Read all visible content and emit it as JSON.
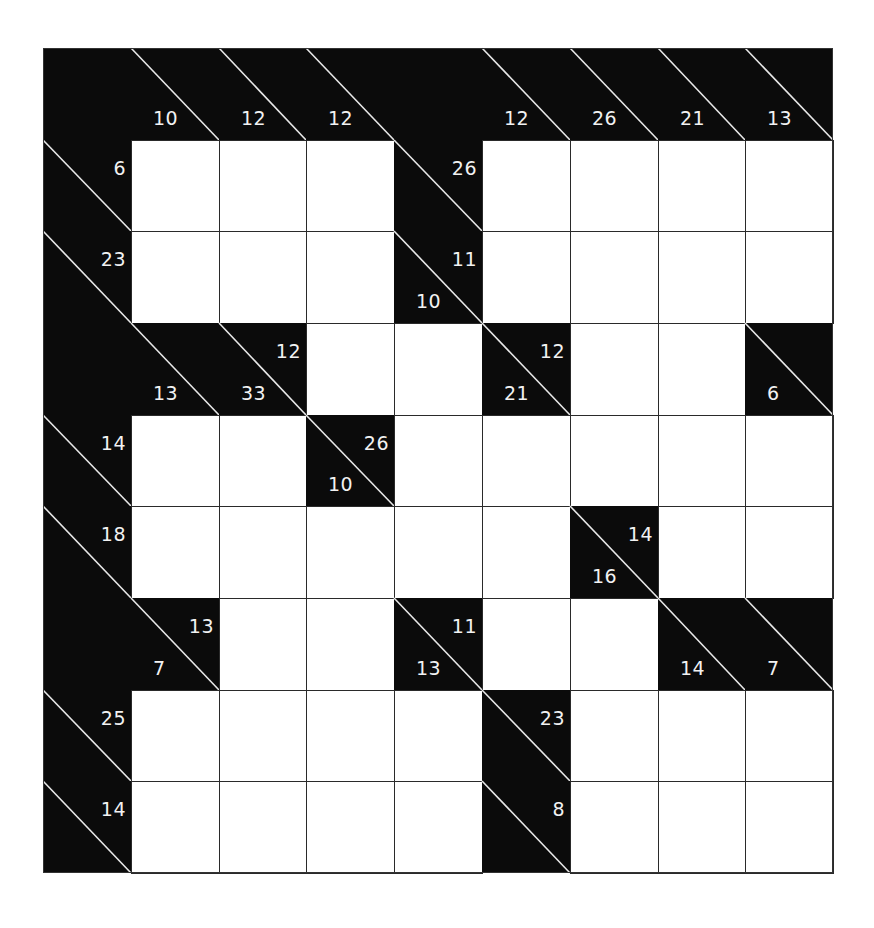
{
  "puzzle": {
    "type": "kakuro",
    "rows": 9,
    "cols": 9,
    "colors": {
      "block": "#0b0b0b",
      "cell": "#ffffff",
      "clue_text": "#f2f2f2",
      "grid_line": "#2a2a2a"
    },
    "grid": [
      [
        {
          "t": "b"
        },
        {
          "t": "c",
          "down": "10"
        },
        {
          "t": "c",
          "down": "12"
        },
        {
          "t": "c",
          "down": "12"
        },
        {
          "t": "b"
        },
        {
          "t": "c",
          "down": "12"
        },
        {
          "t": "c",
          "down": "26"
        },
        {
          "t": "c",
          "down": "21"
        },
        {
          "t": "c",
          "down": "13"
        }
      ],
      [
        {
          "t": "c",
          "across": "6"
        },
        {
          "t": "w"
        },
        {
          "t": "w"
        },
        {
          "t": "w"
        },
        {
          "t": "c",
          "across": "26"
        },
        {
          "t": "w"
        },
        {
          "t": "w"
        },
        {
          "t": "w"
        },
        {
          "t": "w"
        }
      ],
      [
        {
          "t": "c",
          "across": "23"
        },
        {
          "t": "w"
        },
        {
          "t": "w"
        },
        {
          "t": "w"
        },
        {
          "t": "c",
          "down": "10",
          "across": "11"
        },
        {
          "t": "w"
        },
        {
          "t": "w"
        },
        {
          "t": "w"
        },
        {
          "t": "w"
        }
      ],
      [
        {
          "t": "b"
        },
        {
          "t": "c",
          "down": "13"
        },
        {
          "t": "c",
          "down": "33",
          "across": "12"
        },
        {
          "t": "w"
        },
        {
          "t": "w"
        },
        {
          "t": "c",
          "down": "21",
          "across": "12"
        },
        {
          "t": "w"
        },
        {
          "t": "w"
        },
        {
          "t": "c",
          "down": "6"
        }
      ],
      [
        {
          "t": "c",
          "across": "14"
        },
        {
          "t": "w"
        },
        {
          "t": "w"
        },
        {
          "t": "c",
          "down": "10",
          "across": "26"
        },
        {
          "t": "w"
        },
        {
          "t": "w"
        },
        {
          "t": "w"
        },
        {
          "t": "w"
        },
        {
          "t": "w"
        }
      ],
      [
        {
          "t": "c",
          "across": "18"
        },
        {
          "t": "w"
        },
        {
          "t": "w"
        },
        {
          "t": "w"
        },
        {
          "t": "w"
        },
        {
          "t": "w"
        },
        {
          "t": "c",
          "down": "16",
          "across": "14"
        },
        {
          "t": "w"
        },
        {
          "t": "w"
        }
      ],
      [
        {
          "t": "b"
        },
        {
          "t": "c",
          "down": "7",
          "across": "13"
        },
        {
          "t": "w"
        },
        {
          "t": "w"
        },
        {
          "t": "c",
          "down": "13",
          "across": "11"
        },
        {
          "t": "w"
        },
        {
          "t": "w"
        },
        {
          "t": "c",
          "down": "14"
        },
        {
          "t": "c",
          "down": "7"
        }
      ],
      [
        {
          "t": "c",
          "across": "25"
        },
        {
          "t": "w"
        },
        {
          "t": "w"
        },
        {
          "t": "w"
        },
        {
          "t": "w"
        },
        {
          "t": "c",
          "across": "23"
        },
        {
          "t": "w"
        },
        {
          "t": "w"
        },
        {
          "t": "w"
        }
      ],
      [
        {
          "t": "c",
          "across": "14"
        },
        {
          "t": "w"
        },
        {
          "t": "w"
        },
        {
          "t": "w"
        },
        {
          "t": "w"
        },
        {
          "t": "c",
          "across": "8"
        },
        {
          "t": "w"
        },
        {
          "t": "w"
        },
        {
          "t": "w"
        }
      ]
    ],
    "col_edges": [
      0,
      88,
      176,
      263,
      351,
      439,
      527,
      615,
      702,
      790
    ],
    "row_edges": [
      0,
      92,
      183,
      275,
      367,
      458,
      550,
      642,
      733,
      825
    ]
  }
}
